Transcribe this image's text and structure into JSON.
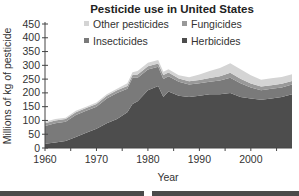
{
  "chart_data": {
    "type": "area",
    "stacked": true,
    "title": "Pesticide use in United States",
    "xlabel": "Year",
    "ylabel": "Millions of kg of pesticide",
    "xlim": [
      1960,
      2008
    ],
    "ylim": [
      0,
      450
    ],
    "xticks": [
      1960,
      1970,
      1980,
      1990,
      2000
    ],
    "yticks": [
      0,
      50,
      100,
      150,
      200,
      250,
      300,
      350,
      400,
      450
    ],
    "legend_position": "top-inside",
    "x": [
      1960,
      1962,
      1964,
      1966,
      1968,
      1970,
      1972,
      1974,
      1976,
      1977,
      1978,
      1980,
      1982,
      1983,
      1984,
      1986,
      1988,
      1990,
      1992,
      1994,
      1996,
      1998,
      2000,
      2002,
      2004,
      2006,
      2008
    ],
    "series": [
      {
        "name": "Herbicides",
        "color": "#4d4d4d",
        "values": [
          15,
          20,
          25,
          40,
          55,
          70,
          90,
          105,
          130,
          160,
          170,
          210,
          225,
          185,
          205,
          190,
          185,
          190,
          195,
          195,
          200,
          185,
          180,
          175,
          180,
          185,
          195
        ]
      },
      {
        "name": "Insecticides",
        "color": "#7a7a7a",
        "values": [
          65,
          70,
          70,
          80,
          80,
          80,
          90,
          95,
          85,
          95,
          85,
          75,
          70,
          65,
          55,
          50,
          45,
          45,
          45,
          50,
          55,
          50,
          40,
          35,
          35,
          35,
          35
        ]
      },
      {
        "name": "Fungicides",
        "color": "#999999",
        "values": [
          10,
          10,
          10,
          10,
          10,
          10,
          10,
          10,
          10,
          10,
          12,
          12,
          12,
          15,
          14,
          12,
          12,
          12,
          14,
          15,
          18,
          16,
          14,
          13,
          13,
          13,
          13
        ]
      },
      {
        "name": "Other pesticides",
        "color": "#d4d4d4",
        "values": [
          5,
          5,
          5,
          5,
          5,
          5,
          5,
          5,
          10,
          10,
          12,
          12,
          12,
          12,
          12,
          12,
          15,
          20,
          25,
          30,
          35,
          35,
          30,
          25,
          25,
          25,
          25
        ]
      }
    ]
  },
  "legend": [
    {
      "label": "Other pesticides",
      "color": "#d4d4d4"
    },
    {
      "label": "Fungicides",
      "color": "#999999"
    },
    {
      "label": "Insecticides",
      "color": "#7a7a7a"
    },
    {
      "label": "Herbicides",
      "color": "#4d4d4d"
    }
  ]
}
